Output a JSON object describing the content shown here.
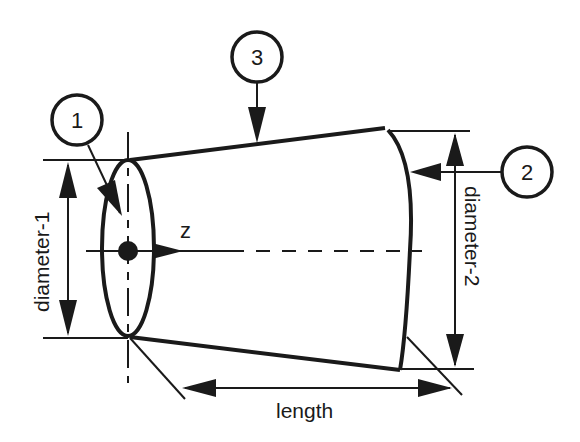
{
  "diagram": {
    "type": "truncated cone geometry",
    "labels": {
      "diameter1": "diameter-1",
      "diameter2": "diameter-2",
      "length": "length",
      "axis": "z"
    },
    "callouts": [
      {
        "id": "1",
        "text": "1",
        "target": "base face (diameter-1 end)"
      },
      {
        "id": "2",
        "text": "2",
        "target": "top face (diameter-2 end)"
      },
      {
        "id": "3",
        "text": "3",
        "target": "lateral (side) surface"
      }
    ],
    "colors": {
      "stroke": "#1a1a1a",
      "background": "#ffffff"
    }
  }
}
